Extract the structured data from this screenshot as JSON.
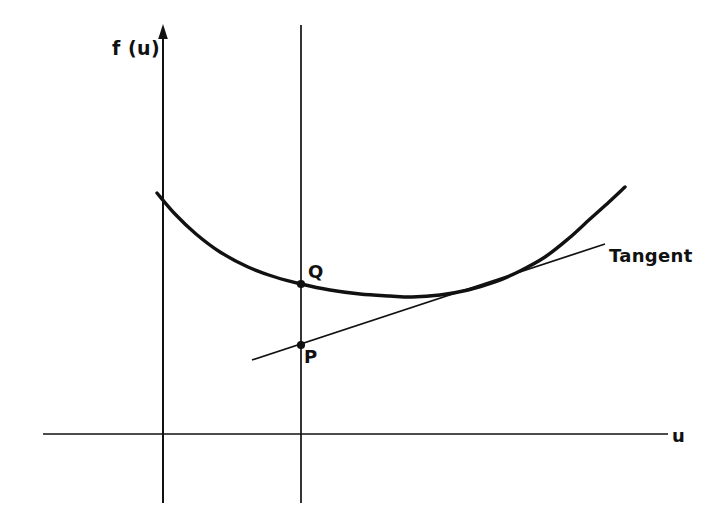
{
  "figure": {
    "background_color": "#ffffff",
    "stroke_color": "#111111",
    "width": 715,
    "height": 528,
    "axes": {
      "y_axis_label": "f (u)",
      "x_axis_label": "u",
      "y_axis_has_arrow": true,
      "x_axis_has_arrow": false
    },
    "labels": {
      "point_q": "Q",
      "point_p": "P",
      "tangent": "Tangent"
    }
  },
  "chart_data": {
    "type": "line",
    "title": "",
    "xlabel": "u",
    "ylabel": "f (u)",
    "grid": false,
    "legend": null,
    "annotations": [
      {
        "name": "Q",
        "label": "Q",
        "x": 301,
        "y": 284,
        "note": "point on the convex curve f(u) at the vertical reference line"
      },
      {
        "name": "P",
        "label": "P",
        "x": 301,
        "y": 345,
        "note": "point on the tangent line directly below Q on the same vertical line"
      },
      {
        "name": "Tangent",
        "label": "Tangent",
        "x": 610,
        "y": 258,
        "note": "label for the straight tangent/supporting line"
      }
    ],
    "series": [
      {
        "name": "f(u)",
        "type": "curve",
        "stroke_width": 3.4,
        "points": [
          [
            157,
            193
          ],
          [
            175,
            214
          ],
          [
            196,
            234
          ],
          [
            220,
            252
          ],
          [
            248,
            267
          ],
          [
            275,
            277
          ],
          [
            301,
            284
          ],
          [
            330,
            290
          ],
          [
            360,
            294
          ],
          [
            390,
            296
          ],
          [
            412,
            297
          ],
          [
            440,
            295
          ],
          [
            468,
            290
          ],
          [
            495,
            282
          ],
          [
            520,
            271
          ],
          [
            545,
            257
          ],
          [
            568,
            239
          ],
          [
            590,
            219
          ],
          [
            609,
            202
          ],
          [
            625,
            187
          ]
        ]
      },
      {
        "name": "Tangent",
        "type": "line",
        "stroke_width": 1.7,
        "points": [
          [
            252,
            360
          ],
          [
            605,
            244
          ]
        ]
      }
    ],
    "axis_lines": [
      {
        "name": "y-axis",
        "x1": 163,
        "y1": 25,
        "x2": 163,
        "y2": 503,
        "stroke_width": 2.0
      },
      {
        "name": "vertical-reference-line",
        "x1": 301,
        "y1": 25,
        "x2": 301,
        "y2": 503,
        "stroke_width": 1.7
      },
      {
        "name": "x-axis",
        "x1": 43,
        "y1": 434,
        "x2": 668,
        "y2": 434,
        "stroke_width": 1.7
      }
    ]
  }
}
